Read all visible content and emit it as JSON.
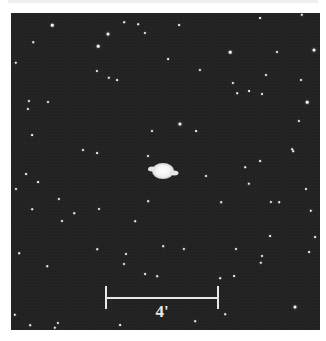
{
  "image": {
    "subject": "planetary nebula star field",
    "background_color": "#222222",
    "star_color": "#f4f4f4"
  },
  "nebula": {
    "x": 163,
    "y": 173,
    "w": 26,
    "h": 16
  },
  "stars": [
    [
      52,
      25,
      2.5
    ],
    [
      108,
      34,
      3
    ],
    [
      98,
      46,
      2.6
    ],
    [
      97,
      71,
      2.2
    ],
    [
      109,
      78,
      2.4
    ],
    [
      117,
      80,
      1.8
    ],
    [
      16,
      63,
      2.4
    ],
    [
      29,
      101,
      2.2
    ],
    [
      28,
      109,
      2.2
    ],
    [
      48,
      102,
      2
    ],
    [
      32,
      135,
      1.8
    ],
    [
      152,
      131,
      2
    ],
    [
      145,
      33,
      2.2
    ],
    [
      138,
      24,
      1.6
    ],
    [
      124,
      22,
      1.6
    ],
    [
      33,
      42,
      1.5
    ],
    [
      83,
      150,
      2
    ],
    [
      302,
      15,
      2.4
    ],
    [
      314,
      50,
      3
    ],
    [
      230,
      52,
      2.6
    ],
    [
      277,
      52,
      2
    ],
    [
      200,
      70,
      2.2
    ],
    [
      233,
      83,
      2.2
    ],
    [
      266,
      75,
      2
    ],
    [
      301,
      80,
      2
    ],
    [
      249,
      91,
      1.8
    ],
    [
      262,
      94,
      2
    ],
    [
      237,
      93,
      1.6
    ],
    [
      307,
      102,
      2.6
    ],
    [
      180,
      124,
      3.2
    ],
    [
      299,
      121,
      2.2
    ],
    [
      179,
      25,
      1.8
    ],
    [
      260,
      18,
      1.8
    ],
    [
      168,
      59,
      1.8
    ],
    [
      196,
      131,
      1.8
    ],
    [
      292,
      149,
      1.6
    ],
    [
      97,
      153,
      1.8
    ],
    [
      148,
      156,
      2
    ],
    [
      26,
      174,
      1.8
    ],
    [
      38,
      182,
      1.8
    ],
    [
      16,
      189,
      2
    ],
    [
      59,
      199,
      2.2
    ],
    [
      99,
      209,
      2
    ],
    [
      32,
      209,
      1.6
    ],
    [
      62,
      221,
      2
    ],
    [
      74,
      213,
      1.5
    ],
    [
      135,
      221,
      1.6
    ],
    [
      148,
      201,
      1.6
    ],
    [
      19,
      253,
      1.6
    ],
    [
      126,
      254,
      2
    ],
    [
      124,
      264,
      2.2
    ],
    [
      97,
      249,
      1.5
    ],
    [
      145,
      274,
      1.8
    ],
    [
      157,
      276,
      1.6
    ],
    [
      47,
      266,
      1.5
    ],
    [
      163,
      246,
      1.6
    ],
    [
      206,
      176,
      2
    ],
    [
      249,
      184,
      2.4
    ],
    [
      260,
      161,
      1.8
    ],
    [
      245,
      167,
      1.6
    ],
    [
      306,
      189,
      2
    ],
    [
      271,
      202,
      2.2
    ],
    [
      279,
      202,
      1.6
    ],
    [
      221,
      202,
      1.6
    ],
    [
      311,
      211,
      2.4
    ],
    [
      270,
      236,
      1.8
    ],
    [
      315,
      237,
      1.8
    ],
    [
      184,
      249,
      2.2
    ],
    [
      236,
      249,
      2
    ],
    [
      262,
      256,
      2
    ],
    [
      261,
      263,
      2.4
    ],
    [
      309,
      252,
      1.8
    ],
    [
      234,
      276,
      1.8
    ],
    [
      220,
      278,
      1.6
    ],
    [
      293,
      151,
      1.6
    ],
    [
      15,
      315,
      2.4
    ],
    [
      58,
      323,
      2.2
    ],
    [
      55,
      328,
      2.4
    ],
    [
      295,
      307,
      3
    ],
    [
      120,
      325,
      1.8
    ],
    [
      195,
      321,
      1.6
    ],
    [
      225,
      314,
      1.6
    ],
    [
      30,
      325,
      1.6
    ]
  ],
  "scale_bar": {
    "label": "4'",
    "x1": 106,
    "x2": 218,
    "y": 297,
    "tick_top": 286,
    "tick_bottom": 309
  }
}
